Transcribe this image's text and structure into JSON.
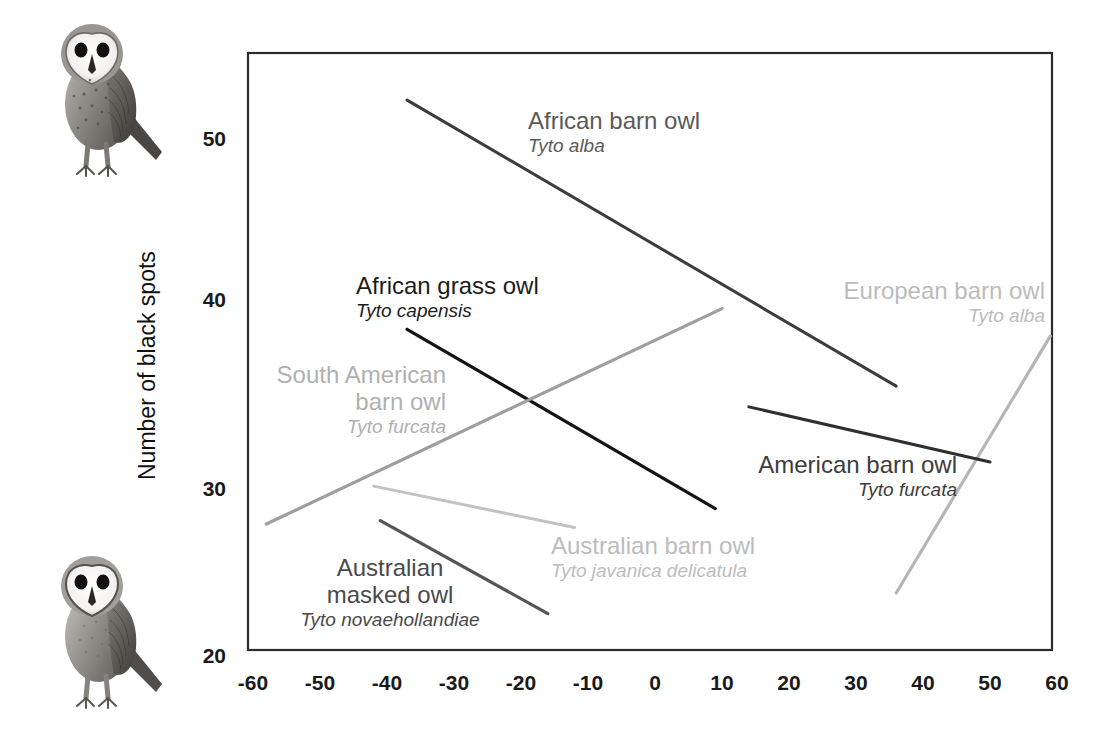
{
  "chart_data": {
    "type": "line",
    "title": "",
    "xlabel": "",
    "ylabel": "Number of black spots",
    "xlim": [
      -63,
      60
    ],
    "ylim": [
      19,
      54
    ],
    "grid": false,
    "legend_position": "inline-annotations",
    "xticks": [
      "-60",
      "-50",
      "-40",
      "-30",
      "-20",
      "-10",
      "0",
      "10",
      "20",
      "30",
      "40",
      "50",
      "60"
    ],
    "xtick_values": [
      -60,
      -50,
      -40,
      -30,
      -20,
      -10,
      0,
      10,
      20,
      30,
      40,
      50,
      60
    ],
    "yticks": [
      "50",
      "40",
      "30",
      "20"
    ],
    "ytick_values": [
      50,
      40,
      30,
      20
    ],
    "series": [
      {
        "name": "African barn owl",
        "scientific": "Tyto alba",
        "color": "#3c3c3c",
        "width": 3.0,
        "x": [
          -37,
          36
        ],
        "y": [
          52.2,
          35.6
        ]
      },
      {
        "name": "African grass owl",
        "scientific": "Tyto capensis",
        "color": "#141414",
        "width": 3.2,
        "x": [
          -37,
          9
        ],
        "y": [
          38.9,
          28.5
        ]
      },
      {
        "name": "South American barn owl",
        "scientific": "Tyto furcata",
        "color": "#9e9e9e",
        "width": 3.2,
        "x": [
          -58,
          10
        ],
        "y": [
          27.6,
          40.1
        ]
      },
      {
        "name": "European barn owl",
        "scientific": "Tyto alba",
        "color": "#b5b5b5",
        "width": 3.2,
        "x": [
          36,
          59
        ],
        "y": [
          23.6,
          38.5
        ]
      },
      {
        "name": "American barn owl",
        "scientific": "Tyto furcata",
        "color": "#2f2f2f",
        "width": 3.0,
        "x": [
          14,
          50
        ],
        "y": [
          34.4,
          31.2
        ]
      },
      {
        "name": "Australian barn owl",
        "scientific": "Tyto javanica delicatula",
        "color": "#c2c2c2",
        "width": 3.0,
        "x": [
          -42,
          -12
        ],
        "y": [
          29.8,
          27.4
        ]
      },
      {
        "name": "Australian masked owl",
        "scientific": "Tyto novaehollandiae",
        "color": "#555555",
        "width": 3.2,
        "x": [
          -41,
          -16
        ],
        "y": [
          27.8,
          22.4
        ]
      }
    ],
    "annotations": [
      {
        "name": "African barn owl",
        "scientific": "Tyto alba",
        "color": "#5a5a5a",
        "align": "left"
      },
      {
        "name": "African grass owl",
        "scientific": "Tyto capensis",
        "color": "#1c1c1c",
        "align": "left"
      },
      {
        "name": "South American barn owl",
        "scientific": "Tyto furcata",
        "color": "#b0b0b0",
        "align": "right"
      },
      {
        "name": "European barn owl",
        "scientific": "Tyto alba",
        "color": "#bcbcbc",
        "align": "right"
      },
      {
        "name": "American barn owl",
        "scientific": "Tyto furcata",
        "color": "#3d3d3d",
        "align": "right"
      },
      {
        "name": "Australian barn owl",
        "scientific": "Tyto javanica delicatula",
        "color": "#bcbcbc",
        "align": "left"
      },
      {
        "name": "Australian masked owl",
        "scientific": "Tyto novaehollandiae",
        "color": "#4a4a4a",
        "align": "center"
      }
    ]
  },
  "axis": {
    "y_label": "Number of black spots",
    "x_ticks": {
      "t0": "-60",
      "t1": "-50",
      "t2": "-40",
      "t3": "-30",
      "t4": "-20",
      "t5": "-10",
      "t6": "0",
      "t7": "10",
      "t8": "20",
      "t9": "30",
      "t10": "40",
      "t11": "50",
      "t12": "60"
    },
    "y_ticks": {
      "t0": "50",
      "t1": "40",
      "t2": "30",
      "t3": "20"
    }
  },
  "labels": {
    "african_barn_owl": {
      "common": "African barn owl",
      "sci": "Tyto alba"
    },
    "african_grass_owl": {
      "common": "African grass owl",
      "sci": "Tyto capensis"
    },
    "south_american_barn_owl": {
      "common_line1": "South American",
      "common_line2": "barn owl",
      "sci": "Tyto furcata"
    },
    "european_barn_owl": {
      "common": "European barn owl",
      "sci": "Tyto alba"
    },
    "american_barn_owl": {
      "common": "American barn owl",
      "sci": "Tyto furcata"
    },
    "australian_barn_owl": {
      "common": "Australian barn owl",
      "sci": "Tyto javanica delicatula"
    },
    "australian_masked_owl": {
      "common_line1": "Australian",
      "common_line2": "masked owl",
      "sci": "Tyto novaehollandiae"
    }
  },
  "illustrations": {
    "top_owl": "barn-owl-illustration",
    "bottom_owl": "barn-owl-illustration"
  }
}
